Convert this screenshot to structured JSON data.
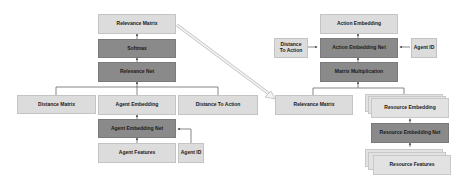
{
  "left": {
    "relevance_matrix": "Relevance Matrix",
    "softmax": "Softmax",
    "relevance_net": "Relevance Net",
    "distance_matrix": "Distance Matrix",
    "agent_embedding": "Agent Embedding",
    "distance_to_action": "Distance To Action",
    "agent_embedding_net": "Agent Embedding Net",
    "agent_features": "Agent Features",
    "agent_id": "Agent ID"
  },
  "right": {
    "action_embedding": "Action Embedding",
    "distance_to_action": "Distance To Action",
    "action_embedding_net": "Action Embedding Net",
    "agent_id": "Agent ID",
    "matrix_multiplication": "Matrix Multiplication",
    "relevance_matrix": "Relevance Matrix",
    "resource_embedding": "Resource Embedding",
    "resource_embedding_net": "Resource Embedding Net",
    "resource_features": "Resource Features"
  },
  "colors": {
    "light_box": "#dcdcdc",
    "dark_box": "#8a8a8a",
    "line": "#555555",
    "transfer_arrow": "#d0d0d0"
  }
}
